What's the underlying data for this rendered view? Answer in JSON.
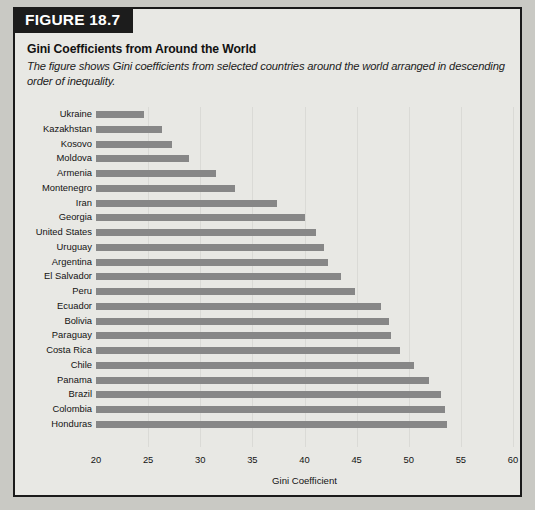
{
  "figure": {
    "tag": "FIGURE 18.7",
    "title": "Gini Coefficients from Around the World",
    "subtitle": "The figure shows Gini coefficients from selected countries around the world arranged in descending order of inequality."
  },
  "colors": {
    "page_background": "#c9c9c4",
    "card_background": "#e8e8e4",
    "card_border": "#1a1a1a",
    "tag_background": "#1c1c1c",
    "tag_text": "#ffffff",
    "bar": "#878787",
    "gridline": "#dadad6",
    "text": "#131313"
  },
  "chart_data": {
    "type": "bar",
    "orientation": "horizontal",
    "title": "Gini Coefficients from Around the World",
    "subtitle": "The figure shows Gini coefficients from selected countries around the world arranged in descending order of inequality.",
    "xlabel": "Gini Coefficient",
    "ylabel": "",
    "xlim": [
      20,
      60
    ],
    "xticks": [
      20,
      25,
      30,
      35,
      40,
      45,
      50,
      55,
      60
    ],
    "grid": true,
    "grid_axis": "x",
    "legend": false,
    "sort_order": "ascending-from-top (descending inequality bottom-to-top)",
    "categories": [
      "Ukraine",
      "Kazakhstan",
      "Kosovo",
      "Moldova",
      "Armenia",
      "Montenegro",
      "Iran",
      "Georgia",
      "United States",
      "Uruguay",
      "Argentina",
      "El Salvador",
      "Peru",
      "Ecuador",
      "Bolivia",
      "Paraguay",
      "Costa Rica",
      "Chile",
      "Panama",
      "Brazil",
      "Colombia",
      "Honduras"
    ],
    "values": [
      24.6,
      26.3,
      27.3,
      28.9,
      31.5,
      33.3,
      37.4,
      40.0,
      41.1,
      41.9,
      42.3,
      43.5,
      44.8,
      47.3,
      48.1,
      48.3,
      49.2,
      50.5,
      51.9,
      53.1,
      53.5,
      53.7
    ]
  }
}
